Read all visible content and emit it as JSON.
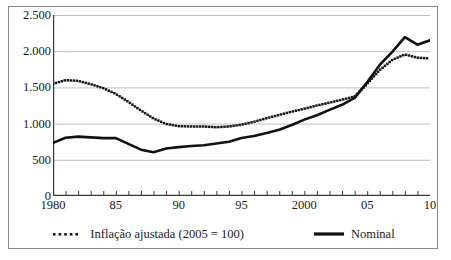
{
  "chart_data": {
    "type": "line",
    "title": "",
    "subtitle": "",
    "xlabel": "",
    "ylabel": "",
    "xlim": [
      1980,
      2010
    ],
    "ylim": [
      0,
      2500
    ],
    "grid": true,
    "legend_position": "bottom",
    "y_ticks": [
      0,
      500,
      1000,
      1500,
      2000,
      2500
    ],
    "y_tick_labels": [
      "0",
      "500",
      "1.000",
      "1.500",
      "2.000",
      "2.500"
    ],
    "x_ticks": [
      1980,
      1981,
      1982,
      1983,
      1984,
      1985,
      1986,
      1987,
      1988,
      1989,
      1990,
      1991,
      1992,
      1993,
      1994,
      1995,
      1996,
      1997,
      1998,
      1999,
      2000,
      2001,
      2002,
      2003,
      2004,
      2005,
      2006,
      2007,
      2008,
      2009,
      2010
    ],
    "x_tick_labels": [
      {
        "value": 1980,
        "label": "1980"
      },
      {
        "value": 1985,
        "label": "85"
      },
      {
        "value": 1990,
        "label": "90"
      },
      {
        "value": 1995,
        "label": "95"
      },
      {
        "value": 2000,
        "label": "2000"
      },
      {
        "value": 2005,
        "label": "05"
      },
      {
        "value": 2010,
        "label": "10"
      }
    ],
    "x": [
      1980,
      1981,
      1982,
      1983,
      1984,
      1985,
      1986,
      1987,
      1988,
      1989,
      1990,
      1991,
      1992,
      1993,
      1994,
      1995,
      1996,
      1997,
      1998,
      1999,
      2000,
      2001,
      2002,
      2003,
      2004,
      2005,
      2006,
      2007,
      2008,
      2009,
      2010
    ],
    "series": [
      {
        "name": "Inflação ajustada (2005 = 100)",
        "style": "dotted",
        "color": "#1a1a1a",
        "values": [
          1550,
          1600,
          1590,
          1545,
          1490,
          1410,
          1300,
          1180,
          1070,
          995,
          965,
          960,
          960,
          950,
          960,
          985,
          1025,
          1075,
          1120,
          1165,
          1205,
          1250,
          1290,
          1330,
          1375,
          1550,
          1740,
          1880,
          1955,
          1910,
          1900
        ]
      },
      {
        "name": "Nominal",
        "style": "solid",
        "color": "#111111",
        "values": [
          735,
          805,
          820,
          810,
          800,
          800,
          720,
          640,
          605,
          655,
          675,
          690,
          700,
          725,
          750,
          800,
          830,
          870,
          915,
          980,
          1055,
          1115,
          1190,
          1260,
          1355,
          1570,
          1810,
          1990,
          2195,
          2090,
          2150
        ]
      }
    ]
  }
}
